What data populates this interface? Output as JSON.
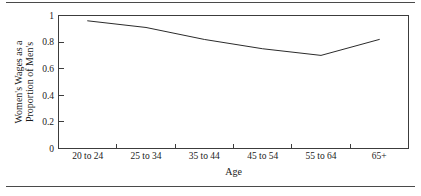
{
  "chart_data": {
    "type": "line",
    "title": "",
    "xlabel": "Age",
    "ylabel": "Women's Wages as a Proportion of Men's",
    "ylabel_line1": "Women's Wages as a",
    "ylabel_line2": "Proportion of Men's",
    "categories": [
      "20 to 24",
      "25 to 34",
      "35 to 44",
      "45 to 54",
      "55 to 64",
      "65+"
    ],
    "values": [
      0.96,
      0.91,
      0.82,
      0.75,
      0.7,
      0.82
    ],
    "series": [
      {
        "name": "Women's wages as a proportion of men's",
        "values": [
          0.96,
          0.91,
          0.82,
          0.75,
          0.7,
          0.82
        ]
      }
    ],
    "ylim": [
      0,
      1
    ],
    "ytick_labels": [
      "0",
      "0.2",
      "0.4",
      "0.6",
      "0.8",
      "1"
    ],
    "ytick_values": [
      0,
      0.2,
      0.4,
      0.6,
      0.8,
      1
    ],
    "grid": false,
    "legend": "none",
    "line_color": "#2b2b2b",
    "axis_color": "#3c3c3c",
    "background_color": "#ffffff"
  }
}
